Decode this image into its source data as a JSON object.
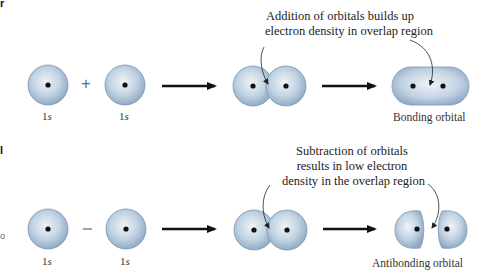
{
  "figure": {
    "top": {
      "annotation": [
        "Addition of orbitals builds up",
        "electron density in overlap region"
      ],
      "operator": "+",
      "orbital_labels": [
        "1s",
        "1s"
      ],
      "result_label": "Bonding orbital"
    },
    "bottom": {
      "annotation": [
        "Subtraction of orbitals",
        "results in low electron",
        "density in the overlap region"
      ],
      "operator": "−",
      "orbital_labels": [
        "1s",
        "1s"
      ],
      "result_label": "Antibonding orbital"
    },
    "edge_fragments": {
      "top": "r",
      "bottom": "l",
      "bottom_side": "o"
    },
    "colors": {
      "orbital_fill_light": "#e6eef6",
      "orbital_fill_dark": "#8fa9c4",
      "orbital_edge": "#7c97b3",
      "nucleus": "#111111",
      "arrow": "#111111"
    }
  }
}
